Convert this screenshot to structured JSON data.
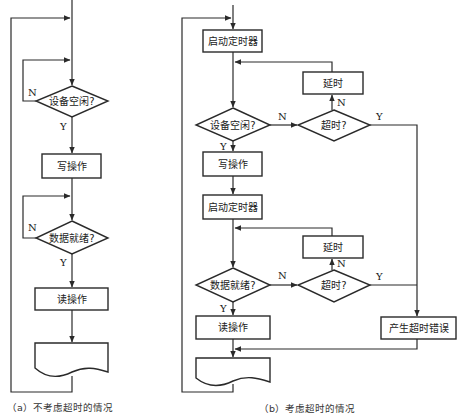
{
  "panel_a": {
    "caption": "（a）不考虑超时的情况",
    "decision_device_idle": "设备空闲?",
    "write_op": "写操作",
    "decision_data_ready": "数据就绪?",
    "read_op": "读操作",
    "label_n1": "N",
    "label_y1": "Y",
    "label_n2": "N",
    "label_y2": "Y"
  },
  "panel_b": {
    "caption": "（b）考虑超时的情况",
    "start_timer_1": "启动定时器",
    "decision_device_idle": "设备空闲?",
    "timeout_1": "超时?",
    "delay_1": "延时",
    "write_op": "写操作",
    "start_timer_2": "启动定时器",
    "decision_data_ready": "数据就绪?",
    "timeout_2": "超时?",
    "delay_2": "延时",
    "read_op": "读操作",
    "timeout_error": "产生超时错误",
    "label_n_idle": "N",
    "label_y_idle": "Y",
    "label_n_timeout1": "N",
    "label_y_timeout1": "Y",
    "label_n_ready": "N",
    "label_y_ready": "Y",
    "label_n_timeout2": "N",
    "label_y_timeout2": "Y"
  }
}
